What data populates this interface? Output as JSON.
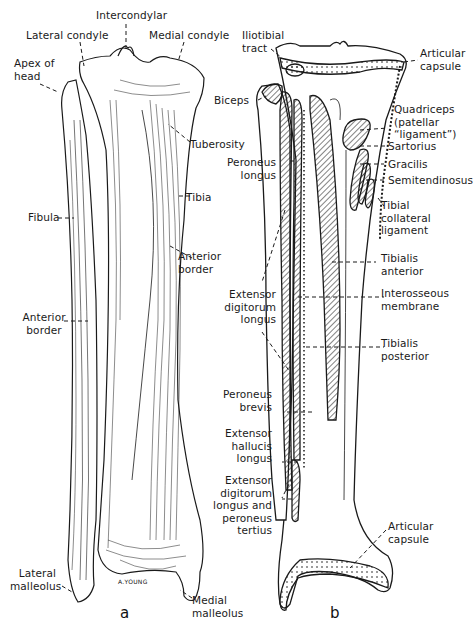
{
  "figure": {
    "panels": [
      {
        "id": "a",
        "letter": "a",
        "view": "anterior view of tibia and fibula",
        "labels": {
          "intercondylar": "Intercondylar",
          "lateral_condyle": "Lateral condyle",
          "medial_condyle": "Medial condyle",
          "apex_of_head": "Apex of\nhead",
          "tuberosity": "Tuberosity",
          "tibia": "Tibia",
          "fibula": "Fibula",
          "anterior_border_tibia": "Anterior\nborder",
          "anterior_border_fibula": "Anterior\nborder",
          "lateral_malleolus": "Lateral\nmalleolus",
          "medial_malleolus": "Medial\nmalleolus"
        },
        "signature": "A.YOUNG"
      },
      {
        "id": "b",
        "letter": "b",
        "view": "muscle and ligament attachments",
        "labels": {
          "iliotibial_tract": "Iliotibial\ntract",
          "articular_capsule_top": "Articular\ncapsule",
          "biceps": "Biceps",
          "quadriceps": "Quadriceps\n(patellar\n“ligament”)",
          "sartorius": "Sartorius",
          "gracilis": "Gracilis",
          "semitendinosus": "Semitendinosus",
          "peroneus_longus": "Peroneus\nlongus",
          "tibial_collateral_ligament": "Tibial\ncollateral\nligament",
          "tibialis_anterior": "Tibialis\nanterior",
          "extensor_digitorum_longus": "Extensor\ndigitorum\nlongus",
          "interosseous_membrane": "Interosseous\nmembrane",
          "tibialis_posterior": "Tibialis\nposterior",
          "peroneus_brevis": "Peroneus\nbrevis",
          "extensor_hallucis_longus": "Extensor\nhallucis\nlongus",
          "extensor_digitorum_longus_peroneus_tertius": "Extensor\ndigitorum\nlongus and\nperoneus\ntertius",
          "articular_capsule_bottom": "Articular\ncapsule"
        }
      }
    ],
    "colors": {
      "ink": "#1a1a1a",
      "background": "#ffffff"
    }
  }
}
